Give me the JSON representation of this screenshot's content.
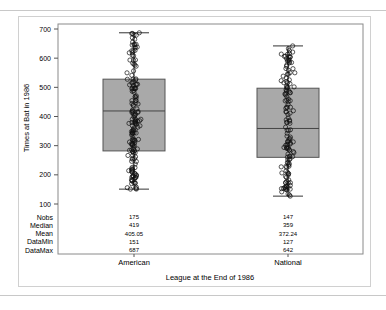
{
  "chart_data": {
    "type": "box",
    "title": "",
    "xlabel": "League at the End of 1986",
    "ylabel": "Times at Bat in 1986",
    "ylim": [
      100,
      700
    ],
    "yticks": [
      100,
      200,
      300,
      400,
      500,
      600,
      700
    ],
    "categories": [
      "American",
      "National"
    ],
    "grid": false,
    "legend": null,
    "boxes": [
      {
        "name": "American",
        "min": 151,
        "q1": 282,
        "median": 419,
        "q3": 528,
        "max": 687
      },
      {
        "name": "National",
        "min": 127,
        "q1": 260,
        "median": 359,
        "q3": 497,
        "max": 642
      }
    ],
    "overlay": "individual data points plotted as open circles",
    "stats_table": {
      "rows": [
        "Nobs",
        "Median",
        "Mean",
        "DataMin",
        "DataMax"
      ],
      "American": [
        "175",
        "419",
        "405.05",
        "151",
        "687"
      ],
      "National": [
        "147",
        "359",
        "372.24",
        "127",
        "642"
      ]
    }
  },
  "colors": {
    "box_fill": "#a9a9a9",
    "box_edge": "#555555",
    "frame": "#d0d0d0"
  }
}
